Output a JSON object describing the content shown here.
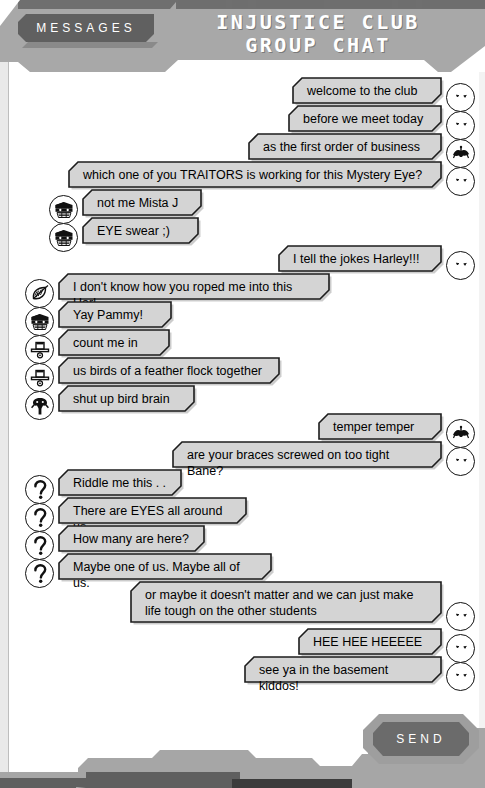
{
  "header": {
    "tab_label": "MESSAGES",
    "title_line1": "INJUSTICE CLUB",
    "title_line2": "GROUP CHAT"
  },
  "footer": {
    "send_label": "SEND"
  },
  "colors": {
    "panel": "#a8a8a8",
    "panel_dark": "#6f6f6f",
    "bubble_fill": "#d4d4d4",
    "bubble_stroke": "#1c1c1c",
    "text": "#000000",
    "tab_fill": "#606060"
  },
  "messages": [
    {
      "id": 0,
      "side": "right",
      "avatar": "joker-face-icon",
      "text": "welcome to the club",
      "width": 148,
      "indent": 0
    },
    {
      "id": 1,
      "side": "right",
      "avatar": "joker-face-icon",
      "text": "before we meet today",
      "width": 152,
      "indent": 0
    },
    {
      "id": 2,
      "side": "right",
      "avatar": "joker-hat-icon",
      "text": "as the first order of business",
      "width": 192,
      "indent": 0
    },
    {
      "id": 3,
      "side": "right",
      "avatar": "joker-face-icon",
      "text": "which one of you TRAITORS is working for this Mystery Eye?",
      "width": 372,
      "indent": 0
    },
    {
      "id": 4,
      "side": "left",
      "avatar": "harley-quinn-icon",
      "text": "not me Mista J",
      "width": 118,
      "indent": 36
    },
    {
      "id": 5,
      "side": "left",
      "avatar": "harley-quinn-icon",
      "text": "EYE swear ;)",
      "width": 115,
      "indent": 36
    },
    {
      "id": 6,
      "side": "right",
      "avatar": "joker-face-icon",
      "text": "I tell the jokes Harley!!!",
      "width": 162,
      "indent": 0
    },
    {
      "id": 7,
      "side": "left",
      "avatar": "poison-ivy-icon",
      "text": "I don't know how you roped me into this Harl",
      "width": 270,
      "indent": 12
    },
    {
      "id": 8,
      "side": "left",
      "avatar": "harley-quinn-icon",
      "text": "Yay Pammy!",
      "width": 112,
      "indent": 12
    },
    {
      "id": 9,
      "side": "left",
      "avatar": "penguin-icon",
      "text": "count me in",
      "width": 110,
      "indent": 12
    },
    {
      "id": 10,
      "side": "left",
      "avatar": "penguin-icon",
      "text": "us birds of a feather flock together",
      "width": 220,
      "indent": 12
    },
    {
      "id": 11,
      "side": "left",
      "avatar": "bane-icon",
      "text": "shut up bird brain",
      "width": 135,
      "indent": 12
    },
    {
      "id": 12,
      "side": "right",
      "avatar": "joker-hat-icon",
      "text": "temper temper",
      "width": 122,
      "indent": 0
    },
    {
      "id": 13,
      "side": "right",
      "avatar": "joker-face-icon",
      "text": "are your braces screwed on too tight Bane?",
      "width": 268,
      "indent": 0
    },
    {
      "id": 14,
      "side": "left",
      "avatar": "riddler-icon",
      "text": "Riddle me this . . .",
      "width": 122,
      "indent": 12
    },
    {
      "id": 15,
      "side": "left",
      "avatar": "riddler-icon",
      "text": "There are EYES all around us.",
      "width": 187,
      "indent": 12
    },
    {
      "id": 16,
      "side": "left",
      "avatar": "riddler-icon",
      "text": "How many are here?",
      "width": 145,
      "indent": 12
    },
    {
      "id": 17,
      "side": "left",
      "avatar": "riddler-icon",
      "text": "Maybe one of us. Maybe all of us.",
      "width": 212,
      "indent": 12
    },
    {
      "id": 18,
      "side": "right",
      "avatar": "joker-face-icon",
      "text": "or maybe it doesn't matter and we can just make\nlife tough on the other students",
      "width": 310,
      "indent": 0
    },
    {
      "id": 19,
      "side": "right",
      "avatar": "joker-face-icon",
      "text": "HEE HEE HEEEEE",
      "width": 142,
      "indent": 0
    },
    {
      "id": 20,
      "side": "right",
      "avatar": "joker-face-icon",
      "text": "see ya in the basement kiddos!",
      "width": 196,
      "indent": 0
    }
  ]
}
